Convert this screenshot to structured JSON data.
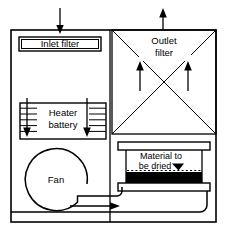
{
  "diagram": {
    "canvas": {
      "width": 228,
      "height": 238,
      "background": "#ffffff",
      "line_color": "#000000"
    },
    "labels": {
      "inlet_filter": "Inlet filter",
      "outlet_filter_line1": "Outlet",
      "outlet_filter_line2": "filter",
      "heater_line1": "Heater",
      "heater_line2": "battery",
      "fan": "Fan",
      "material_line1": "Material to",
      "material_line2": "be dried"
    },
    "components": {
      "outer_enclosure": {
        "x": 11,
        "y": 30,
        "width": 205,
        "height": 192
      },
      "inlet_filter_box": {
        "x": 19,
        "y": 37,
        "width": 82,
        "height": 14
      },
      "heater_battery_box": {
        "x": 20,
        "y": 103,
        "width": 86,
        "height": 36,
        "coil_lines": 6
      },
      "fan_circle": {
        "cx": 56,
        "cy": 180,
        "r": 31
      },
      "outlet_filter_box": {
        "x": 112,
        "y": 30,
        "width": 104,
        "height": 104,
        "diagonals": 2
      },
      "material_chamber": {
        "x": 122,
        "y": 146,
        "width": 84,
        "height": 40
      },
      "material_bed_color": "#000000",
      "divider_x": 110
    },
    "flow_arrows": {
      "inlet_air_in": {
        "direction": "down",
        "x": 60,
        "y_from": 9,
        "y_to": 30
      },
      "outlet_air_out": {
        "direction": "up",
        "x": 163,
        "y_from": 30,
        "y_to": 9
      },
      "heater_arrow_left": {
        "direction": "down",
        "x": 27,
        "y_from": 98,
        "y_to": 136
      },
      "heater_arrow_right": {
        "direction": "down",
        "x": 87,
        "y_from": 98,
        "y_to": 136
      },
      "outlet_riser_left": {
        "direction": "up",
        "x": 140,
        "y_from": 90,
        "y_to": 62
      },
      "outlet_riser_right": {
        "direction": "up",
        "x": 188,
        "y_from": 90,
        "y_to": 62
      },
      "duct_to_chamber": {
        "direction": "right",
        "y": 207,
        "x_from": 70,
        "x_to": 122
      },
      "material_pointer": {
        "direction": "down-right",
        "x": 178,
        "y": 170
      }
    }
  }
}
